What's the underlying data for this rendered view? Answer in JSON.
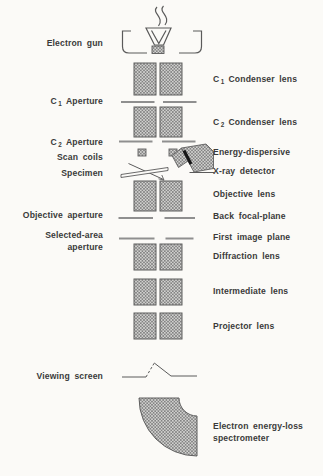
{
  "diagram": {
    "left_labels": {
      "electron_gun": "Electron gun",
      "c1_aperture": {
        "pre": "C",
        "sub": "1",
        "post": "Aperture"
      },
      "c2_aperture": {
        "pre": "C",
        "sub": "2",
        "post": "Aperture"
      },
      "scan_coils": "Scan coils",
      "specimen": "Specimen",
      "objective_aperture": "Objective aperture",
      "selected_area_aperture": {
        "line1": "Selected-area",
        "line2": "aperture"
      },
      "viewing_screen": "Viewing screen"
    },
    "right_labels": {
      "c1_condenser_lens": {
        "pre": "C",
        "sub": "1",
        "post": "Condenser lens"
      },
      "c2_condenser_lens": {
        "pre": "C",
        "sub": "2",
        "post": "Condenser lens"
      },
      "edx_detector": {
        "line1": "Energy-dispersive",
        "line2": "X-ray detector"
      },
      "objective_lens": "Objective lens",
      "back_focal_plane": "Back focal-plane",
      "first_image_plane": "First image plane",
      "diffraction_lens": "Diffraction lens",
      "intermediate_lens": "Intermediate lens",
      "projector_lens": "Projector lens",
      "eels_spectrometer": {
        "line1": "Electron energy-loss",
        "line2": "spectrometer"
      }
    },
    "components": [
      "electron-gun",
      "c1-condenser-lens",
      "c1-aperture",
      "c2-condenser-lens",
      "c2-aperture",
      "scan-coils",
      "specimen",
      "energy-dispersive-xray-detector",
      "objective-lens",
      "objective-aperture",
      "selected-area-aperture",
      "diffraction-lens",
      "intermediate-lens",
      "projector-lens",
      "viewing-screen",
      "electron-energy-loss-spectrometer"
    ],
    "colors": {
      "background": "#fbfaf7",
      "ink": "#3a3a3a",
      "outline": "#5a5a5a",
      "aperture_line": "#8f8f8f",
      "hatch_fill": "#d2d2d0",
      "hatch_stroke": "#777777",
      "detector_slit": "#161616"
    }
  }
}
